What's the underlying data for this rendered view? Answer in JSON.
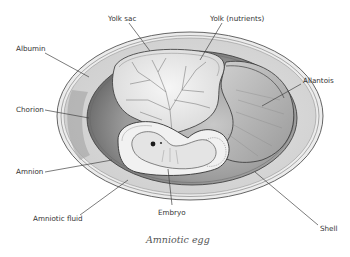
{
  "diagram": {
    "title": "Amniotic egg",
    "labels": {
      "yolk_sac": "Yolk sac",
      "yolk": "Yolk (nutrients)",
      "albumin": "Albumin",
      "allantois": "Allantois",
      "chorion": "Chorion",
      "amnion": "Amnion",
      "amniotic_fluid": "Amniotic fluid",
      "embryo": "Embryo",
      "shell": "Shell"
    }
  },
  "colors": {
    "shell": "#e6e6e6",
    "albumin": "#d4d4d4",
    "chorion_cavity": "#9e9e9e",
    "yolk": "#efefef",
    "allantois": "#bdbdbd",
    "amnion": "#f2f2f2",
    "line": "#444444"
  }
}
